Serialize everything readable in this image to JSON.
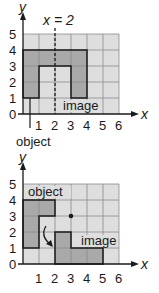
{
  "colors": {
    "grid_bg": "#dedede",
    "grid_line": "#8c8c8c",
    "shape_fill": "#a9a9a9",
    "outline": "#1a1a1a",
    "text": "#1a1a1a"
  },
  "diagrams": [
    {
      "id": "reflection",
      "transformation": "reflection over x = 2",
      "axis_x_label": "x",
      "axis_y_label": "y",
      "x_ticks": [
        "1",
        "2",
        "3",
        "4",
        "5",
        "6"
      ],
      "y_ticks": [
        "0",
        "1",
        "2",
        "3",
        "4",
        "5"
      ],
      "line_label": "x = 2",
      "object_label": "object",
      "image_label": "image",
      "object_vertices": [
        [
          0,
          1
        ],
        [
          0,
          4
        ],
        [
          2,
          4
        ],
        [
          2,
          3
        ],
        [
          1,
          3
        ],
        [
          1,
          1
        ]
      ],
      "image_vertices": [
        [
          2,
          4
        ],
        [
          4,
          4
        ],
        [
          4,
          1
        ],
        [
          3,
          1
        ],
        [
          3,
          3
        ],
        [
          2,
          3
        ]
      ]
    },
    {
      "id": "rotation",
      "transformation": "rotation 90° counterclockwise about (3,3)",
      "axis_x_label": "x",
      "axis_y_label": "y",
      "x_ticks": [
        "1",
        "2",
        "3",
        "4",
        "5",
        "6"
      ],
      "y_ticks": [
        "0",
        "1",
        "2",
        "3",
        "4",
        "5"
      ],
      "object_label": "object",
      "image_label": "image",
      "center_point": [
        3,
        3
      ],
      "object_vertices": [
        [
          0,
          1
        ],
        [
          0,
          4
        ],
        [
          2,
          4
        ],
        [
          2,
          3
        ],
        [
          1,
          3
        ],
        [
          1,
          1
        ]
      ],
      "image_vertices": [
        [
          2,
          0
        ],
        [
          2,
          2
        ],
        [
          3,
          2
        ],
        [
          3,
          1
        ],
        [
          5,
          1
        ],
        [
          5,
          0
        ]
      ]
    }
  ]
}
